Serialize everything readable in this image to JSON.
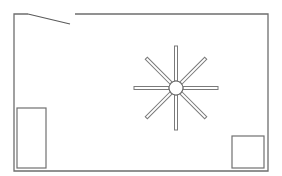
{
  "diagram": {
    "type": "floor-plan",
    "colors": {
      "background": "#ffffff",
      "wall": "#6e6e6e",
      "furniture": "#707070"
    },
    "room": {
      "left": 14,
      "top": 14,
      "right": 268,
      "bottom": 171
    },
    "door": {
      "hinge": [
        14,
        14
      ],
      "gap_start_x": 28,
      "gap_end_x": 75,
      "leaf_end": [
        70,
        24
      ]
    },
    "ceiling_fan": {
      "center": [
        176,
        88
      ],
      "hub_radius": 7,
      "blade_length": 41,
      "blade_count": 8
    },
    "furniture": [
      {
        "name": "bed",
        "x": 17,
        "y": 108,
        "w": 29,
        "h": 60
      },
      {
        "name": "nightstand",
        "x": 232,
        "y": 136,
        "w": 32,
        "h": 32
      }
    ]
  }
}
